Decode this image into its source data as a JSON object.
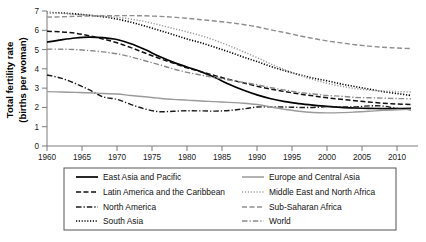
{
  "chart_data": {
    "type": "line",
    "title": "",
    "xlabel": "",
    "ylabel": "Total fertility rate\n(births per woman)",
    "ylabel_line1": "Total fertility rate",
    "ylabel_line2": "(births per woman)",
    "xlim": [
      1960,
      2013
    ],
    "ylim": [
      0,
      7
    ],
    "xticks": [
      1960,
      1965,
      1970,
      1975,
      1980,
      1985,
      1990,
      1995,
      2000,
      2005,
      2010
    ],
    "xtick_labels": [
      "1960",
      "1965",
      "1970",
      "1975",
      "1980",
      "1985",
      "1990",
      "1995",
      "2000",
      "2005",
      "2010"
    ],
    "yticks": [
      0,
      1,
      2,
      3,
      4,
      5,
      6,
      7
    ],
    "ytick_labels": [
      "0",
      "1",
      "2",
      "3",
      "4",
      "5",
      "6",
      "7"
    ],
    "grid": false,
    "legend_position": "below",
    "x": [
      1960,
      1962,
      1964,
      1966,
      1968,
      1970,
      1972,
      1974,
      1976,
      1978,
      1980,
      1982,
      1984,
      1986,
      1988,
      1990,
      1992,
      1994,
      1996,
      1998,
      2000,
      2002,
      2004,
      2006,
      2008,
      2010,
      2012
    ],
    "series": [
      {
        "name": "East Asia and Pacific",
        "style": "solid",
        "color": "#000000",
        "width": 1.7,
        "dash": "",
        "values": [
          5.38,
          5.5,
          5.6,
          5.65,
          5.62,
          5.52,
          5.3,
          5.0,
          4.65,
          4.35,
          4.1,
          3.85,
          3.55,
          3.2,
          2.9,
          2.65,
          2.45,
          2.3,
          2.2,
          2.12,
          2.05,
          2.0,
          1.97,
          1.95,
          1.94,
          1.94,
          1.95
        ]
      },
      {
        "name": "Latin America and the Caribbean",
        "style": "dashed",
        "color": "#111111",
        "width": 1.5,
        "dash": "5,2.5",
        "values": [
          5.95,
          5.92,
          5.85,
          5.72,
          5.55,
          5.35,
          5.1,
          4.82,
          4.55,
          4.3,
          4.05,
          3.85,
          3.65,
          3.45,
          3.28,
          3.1,
          2.95,
          2.82,
          2.7,
          2.6,
          2.5,
          2.42,
          2.35,
          2.28,
          2.22,
          2.18,
          2.15
        ]
      },
      {
        "name": "North America",
        "style": "dashdot",
        "color": "#1a1a1a",
        "width": 1.4,
        "dash": "5.5,2,1.3,2",
        "values": [
          3.68,
          3.52,
          3.25,
          2.92,
          2.55,
          2.42,
          2.15,
          1.92,
          1.78,
          1.8,
          1.83,
          1.82,
          1.81,
          1.84,
          1.92,
          2.02,
          2.03,
          2.02,
          2.0,
          2.0,
          2.04,
          2.02,
          2.03,
          2.08,
          2.07,
          1.95,
          1.88
        ]
      },
      {
        "name": "South Asia",
        "style": "dotted",
        "color": "#000000",
        "width": 1.6,
        "dash": "1.2,1.6",
        "values": [
          6.92,
          6.9,
          6.85,
          6.78,
          6.7,
          6.58,
          6.42,
          6.22,
          6.0,
          5.78,
          5.55,
          5.35,
          5.12,
          4.88,
          4.62,
          4.38,
          4.12,
          3.9,
          3.7,
          3.52,
          3.38,
          3.22,
          3.08,
          2.95,
          2.82,
          2.72,
          2.62
        ]
      },
      {
        "name": "Europe and Central Asia",
        "style": "solid",
        "color": "#9a9a9a",
        "width": 1.4,
        "dash": "",
        "values": [
          2.82,
          2.8,
          2.78,
          2.76,
          2.72,
          2.7,
          2.62,
          2.55,
          2.48,
          2.42,
          2.38,
          2.33,
          2.3,
          2.26,
          2.22,
          2.15,
          2.02,
          1.9,
          1.8,
          1.74,
          1.72,
          1.73,
          1.76,
          1.8,
          1.85,
          1.88,
          1.9
        ]
      },
      {
        "name": "Middle East and North Africa",
        "style": "dotted",
        "color": "#9b9b9b",
        "width": 1.5,
        "dash": "1.2,1.7",
        "values": [
          6.92,
          6.88,
          6.82,
          6.78,
          6.72,
          6.68,
          6.58,
          6.45,
          6.28,
          6.1,
          5.92,
          5.72,
          5.48,
          5.2,
          4.9,
          4.58,
          4.25,
          3.95,
          3.68,
          3.45,
          3.25,
          3.1,
          2.98,
          2.9,
          2.85,
          2.82,
          2.8
        ]
      },
      {
        "name": "Sub-Saharan Africa",
        "style": "dashed",
        "color": "#8e8e8e",
        "width": 1.4,
        "dash": "5,2.5",
        "values": [
          6.68,
          6.7,
          6.72,
          6.74,
          6.75,
          6.76,
          6.76,
          6.75,
          6.72,
          6.68,
          6.62,
          6.55,
          6.48,
          6.4,
          6.3,
          6.18,
          6.02,
          5.88,
          5.72,
          5.58,
          5.45,
          5.35,
          5.25,
          5.18,
          5.12,
          5.08,
          5.05
        ]
      },
      {
        "name": "World",
        "style": "dashdot",
        "color": "#8a8a8a",
        "width": 1.4,
        "dash": "5.5,2,1.3,2",
        "values": [
          5.02,
          5.02,
          5.0,
          4.95,
          4.88,
          4.78,
          4.62,
          4.42,
          4.22,
          4.0,
          3.82,
          3.68,
          3.55,
          3.42,
          3.3,
          3.18,
          3.02,
          2.9,
          2.78,
          2.7,
          2.62,
          2.58,
          2.52,
          2.5,
          2.48,
          2.46,
          2.45
        ]
      }
    ]
  },
  "legend": {
    "columns": [
      {
        "entries": [
          {
            "label": "East Asia and Pacific",
            "series_index": 0
          },
          {
            "label": "Latin America and the Caribbean",
            "series_index": 1
          },
          {
            "label": "North America",
            "series_index": 2
          },
          {
            "label": "South Asia",
            "series_index": 3
          }
        ]
      },
      {
        "entries": [
          {
            "label": "Europe and Central Asia",
            "series_index": 4
          },
          {
            "label": "Middle East and North Africa",
            "series_index": 5
          },
          {
            "label": "Sub-Saharan Africa",
            "series_index": 6
          },
          {
            "label": "World",
            "series_index": 7
          }
        ]
      }
    ]
  },
  "colors": {
    "background": "#ffffff",
    "axis": "#7a7a7a",
    "text": "#000000",
    "legend_border": "#555555"
  }
}
